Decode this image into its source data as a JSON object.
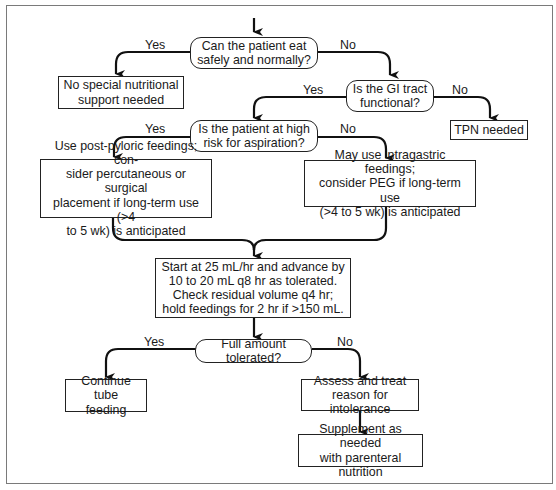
{
  "diagram": {
    "nodes": {
      "q_eat": {
        "type": "decision",
        "text": "Can the patient eat safely and normally?"
      },
      "no_support": {
        "type": "process",
        "text": "No special nutritional support needed"
      },
      "q_gi": {
        "type": "decision",
        "text": "Is the GI tract functional?"
      },
      "tpn": {
        "type": "process",
        "text": "TPN needed"
      },
      "q_aspiration": {
        "type": "decision",
        "text": "Is the patient at high risk for aspiration?"
      },
      "post_pyloric": {
        "type": "process",
        "text": "Use post-pyloric feedings; consider percutaneous or surgical placement if long-term use (>4 to 5 wk) is anticipated"
      },
      "intragastric": {
        "type": "process",
        "text": "May use intragastric feedings; consider PEG if long-term use (>4 to 5 wk) is anticipated"
      },
      "start_rate": {
        "type": "process",
        "text": "Start at 25 mL/hr and advance by 10 to 20 mL q8 hr as tolerated. Check residual volume q4 hr; hold feedings for 2 hr if >150 mL."
      },
      "q_tolerated": {
        "type": "decision",
        "text": "Full amount tolerated?"
      },
      "continue": {
        "type": "process",
        "text": "Continue tube feeding"
      },
      "assess": {
        "type": "process",
        "text": "Assess and treat reason for intolerance"
      },
      "supplement": {
        "type": "process",
        "text": "Supplement as needed with parenteral nutrition"
      }
    },
    "edge_labels": {
      "eat_yes": "Yes",
      "eat_no": "No",
      "gi_yes": "Yes",
      "gi_no": "No",
      "asp_yes": "Yes",
      "asp_no": "No",
      "tol_yes": "Yes",
      "tol_no": "No"
    },
    "lines": {
      "q_eat_1": "Can the patient eat",
      "q_eat_2": "safely and normally?",
      "no_support_1": "No special nutritional",
      "no_support_2": "support needed",
      "q_gi_1": "Is the GI tract",
      "q_gi_2": "functional?",
      "tpn_1": "TPN needed",
      "q_asp_1": "Is the patient at high",
      "q_asp_2": "risk for aspiration?",
      "pp_1": "Use post-pyloric feedings; con-",
      "pp_2": "sider percutaneous or surgical",
      "pp_3": "placement if long-term use (>4",
      "pp_4": "to 5 wk) is anticipated",
      "ig_1": "May use intragastric feedings;",
      "ig_2": "consider PEG if long-term use",
      "ig_3": "(>4 to 5 wk) is anticipated",
      "sr_1": "Start at 25 mL/hr and advance by",
      "sr_2": "10 to 20 mL q8 hr as tolerated.",
      "sr_3": "Check residual volume q4 hr;",
      "sr_4": "hold feedings for 2 hr if >150 mL.",
      "q_tol_1": "Full amount tolerated?",
      "cont_1": "Continue tube",
      "cont_2": "feeding",
      "as_1": "Assess and treat",
      "as_2": "reason for intolerance",
      "sup_1": "Supplement as needed",
      "sup_2": "with parenteral nutrition"
    }
  }
}
